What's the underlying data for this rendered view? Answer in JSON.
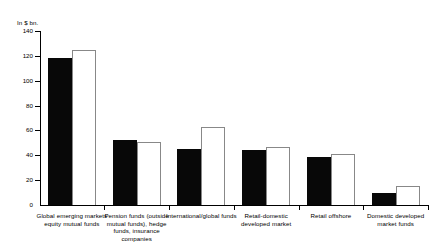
{
  "chart_data": {
    "type": "bar",
    "title": "",
    "subtitle": "",
    "xlabel": "",
    "ylabel": "In $ bn.",
    "ylim": [
      0,
      140
    ],
    "yticks": [
      0,
      20,
      40,
      60,
      80,
      100,
      120,
      140
    ],
    "ytick_labels": [
      "0",
      "20",
      "40",
      "60",
      "80",
      "100",
      "120",
      "140"
    ],
    "grid": false,
    "legend": "none",
    "categories": [
      "Global emerging markets equity mutual funds",
      "Pension funds (outside mutual funds), hedge funds, insurance companies",
      "International/global funds",
      "Retail-domestic developed market",
      "Retail offshore",
      "Domestic developed market funds"
    ],
    "series": [
      {
        "name": "series-dark",
        "color": "#080808",
        "values": [
          118,
          52,
          45,
          44,
          39,
          10
        ]
      },
      {
        "name": "series-light",
        "color": "#ffffff",
        "values": [
          125,
          51,
          63,
          47,
          41,
          15
        ]
      }
    ]
  }
}
